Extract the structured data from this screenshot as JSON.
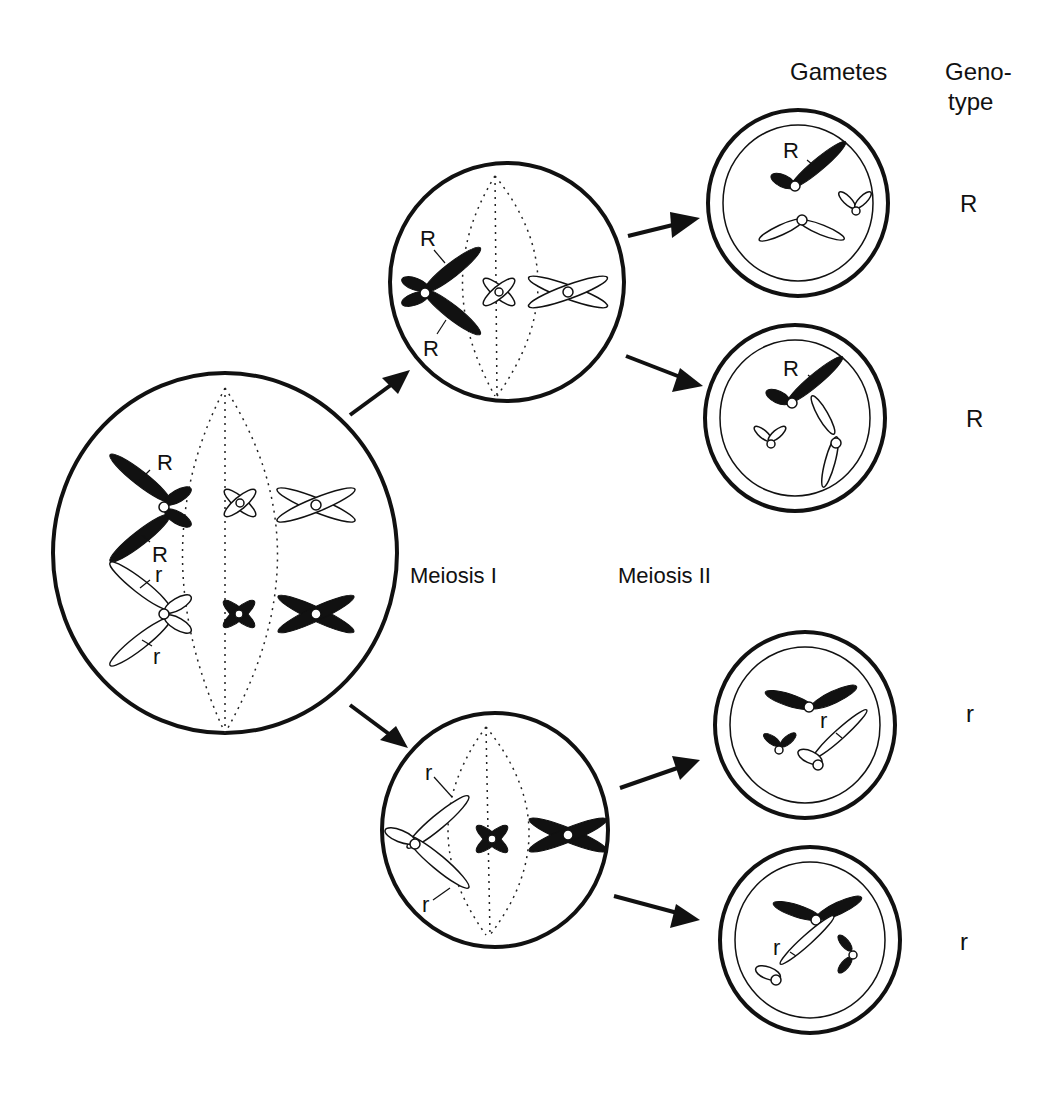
{
  "headers": {
    "gametes": "Gametes",
    "genotype_line1": "Geno-",
    "genotype_line2": "type"
  },
  "stages": {
    "meiosis1": "Meiosis I",
    "meiosis2": "Meiosis II"
  },
  "parent_cell": {
    "alleles": [
      "R",
      "R",
      "r",
      "r"
    ]
  },
  "meiosis1_top_cell": {
    "alleles": [
      "R",
      "R"
    ]
  },
  "meiosis1_bottom_cell": {
    "alleles": [
      "r",
      "r"
    ]
  },
  "gametes": [
    {
      "allele_label": "R",
      "genotype": "R"
    },
    {
      "allele_label": "R",
      "genotype": "R"
    },
    {
      "allele_label": "r",
      "genotype": "r"
    },
    {
      "allele_label": "r",
      "genotype": "r"
    }
  ],
  "colors": {
    "ink": "#111111",
    "background": "#ffffff"
  }
}
